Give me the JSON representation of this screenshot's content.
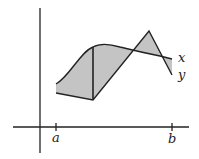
{
  "diagram": {
    "curve_labels": {
      "upper": "x",
      "lower": "y"
    },
    "axis_ticks": {
      "left": "a",
      "right": "b"
    },
    "colors": {
      "shade": "#c4c4c4",
      "stroke": "#222222",
      "background": "#ffffff"
    }
  }
}
